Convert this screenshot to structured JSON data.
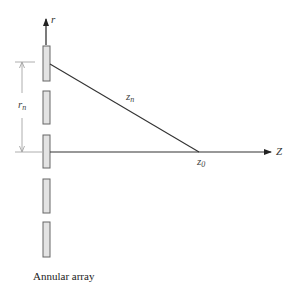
{
  "diagram": {
    "caption": "Annular array",
    "labels": {
      "r_axis": "r",
      "z_axis": "Z",
      "rn_main": "r",
      "rn_sub": "n",
      "zn_main": "z",
      "zn_sub": "n",
      "z0_main": "z",
      "z0_sub": "0"
    },
    "elements": [
      {
        "id": 1,
        "x": 43,
        "y": 46,
        "w": 7,
        "h": 35
      },
      {
        "id": 2,
        "x": 43,
        "y": 91,
        "w": 7,
        "h": 33
      },
      {
        "id": 3,
        "x": 43,
        "y": 135,
        "w": 7,
        "h": 33
      },
      {
        "id": 4,
        "x": 43,
        "y": 179,
        "w": 7,
        "h": 34
      },
      {
        "id": 5,
        "x": 43,
        "y": 222,
        "w": 7,
        "h": 35
      }
    ],
    "colors": {
      "element_fill": "#e3e3e3",
      "element_stroke": "#666666",
      "line": "#333333",
      "dimension": "#999999"
    }
  }
}
